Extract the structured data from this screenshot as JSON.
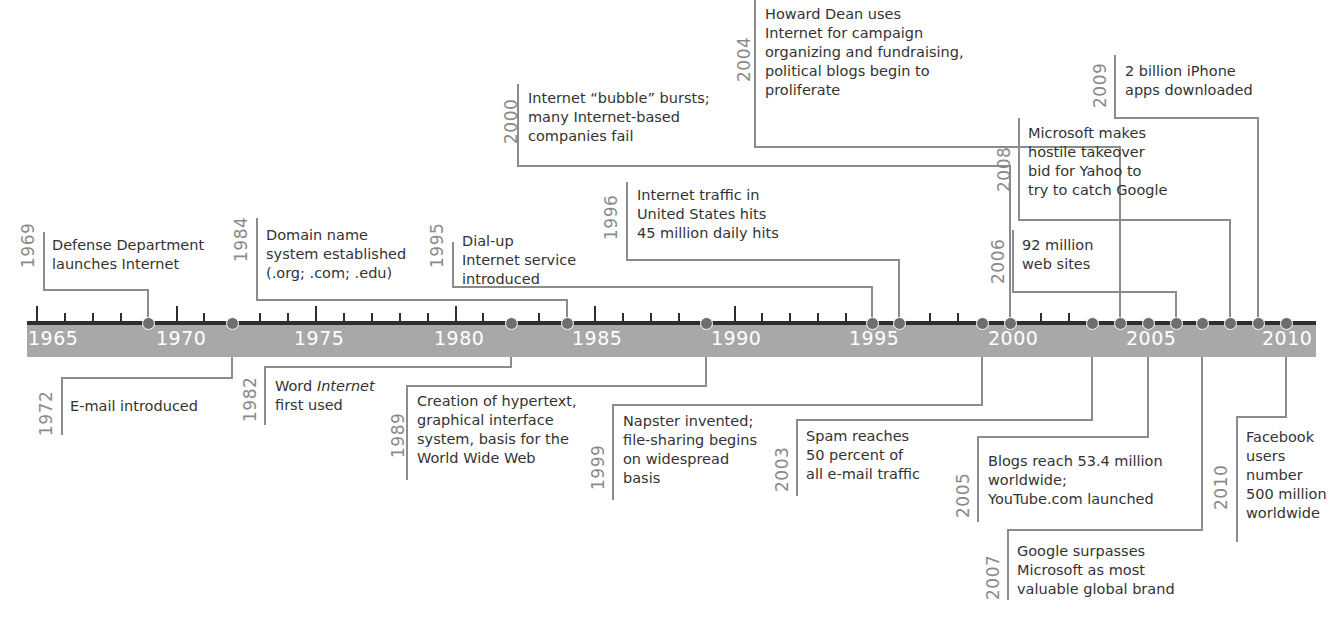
{
  "axis": {
    "start_year": 1965,
    "end_year": 2010,
    "labels": [
      "1965",
      "1970",
      "1975",
      "1980",
      "1985",
      "1990",
      "1995",
      "2000",
      "2005",
      "2010"
    ],
    "band_color": "#a8a8a8",
    "line_color": "#2e2e2e",
    "dot_color": "#6e6e6e",
    "connector_color": "#8c8c8c"
  },
  "events": [
    {
      "year": "1969",
      "side": "above",
      "lines": [
        "Defense Department",
        "launches Internet"
      ]
    },
    {
      "year": "1972",
      "side": "below",
      "lines": [
        "E-mail introduced"
      ]
    },
    {
      "year": "1982",
      "side": "below",
      "lines": [
        "Word Internet",
        "first used"
      ],
      "italic_word": "Internet"
    },
    {
      "year": "1984",
      "side": "above",
      "lines": [
        "Domain name",
        "system established",
        "(.org; .com; .edu)"
      ]
    },
    {
      "year": "1989",
      "side": "below",
      "lines": [
        "Creation of hypertext,",
        "graphical interface",
        "system, basis for the",
        "World Wide Web"
      ]
    },
    {
      "year": "1995",
      "side": "above",
      "lines": [
        "Dial-up",
        "Internet service",
        "introduced"
      ]
    },
    {
      "year": "1996",
      "side": "above",
      "lines": [
        "Internet traffic in",
        "United States hits",
        "45 million daily hits"
      ]
    },
    {
      "year": "1999",
      "side": "below",
      "lines": [
        "Napster invented;",
        "file-sharing begins",
        "on widespread",
        "basis"
      ]
    },
    {
      "year": "2000",
      "side": "above",
      "lines": [
        "Internet “bubble” bursts;",
        "many Internet-based",
        "companies fail"
      ]
    },
    {
      "year": "2003",
      "side": "below",
      "lines": [
        "Spam reaches",
        "50 percent of",
        "all e-mail traffic"
      ]
    },
    {
      "year": "2004",
      "side": "above",
      "lines": [
        "Howard Dean uses",
        "Internet for campaign",
        "organizing and fundraising,",
        "political blogs begin to",
        "proliferate"
      ]
    },
    {
      "year": "2005",
      "side": "below",
      "lines": [
        "Blogs reach 53.4 million",
        "worldwide;",
        "YouTube.com launched"
      ]
    },
    {
      "year": "2006",
      "side": "above",
      "lines": [
        "92 million",
        "web sites"
      ]
    },
    {
      "year": "2007",
      "side": "below",
      "lines": [
        "Google surpasses",
        "Microsoft as most",
        "valuable global brand"
      ]
    },
    {
      "year": "2008",
      "side": "above",
      "lines": [
        "Microsoft makes",
        "hostile takeover",
        "bid for Yahoo to",
        "try to catch Google"
      ]
    },
    {
      "year": "2009",
      "side": "above",
      "lines": [
        "2 billion iPhone",
        "apps downloaded"
      ]
    },
    {
      "year": "2010",
      "side": "below",
      "lines": [
        "Facebook",
        "users",
        "number",
        "500 million",
        "worldwide"
      ]
    }
  ]
}
